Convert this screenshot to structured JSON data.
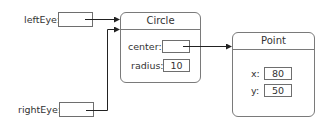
{
  "variables": [
    {
      "name": "leftEye",
      "label": "leftEye:",
      "points_to": "Circle"
    },
    {
      "name": "rightEye",
      "label": "rightEye:",
      "points_to": "Circle"
    }
  ],
  "circle": {
    "title": "Circle",
    "fields": {
      "center": {
        "label": "center:",
        "value": "",
        "points_to": "Point"
      },
      "radius": {
        "label": "radius:",
        "value": "10"
      }
    }
  },
  "point": {
    "title": "Point",
    "fields": {
      "x": {
        "label": "x:",
        "value": "80"
      },
      "y": {
        "label": "y:",
        "value": "50"
      }
    }
  },
  "colors": {
    "line": "#222222",
    "border": "#7a7a7a"
  }
}
